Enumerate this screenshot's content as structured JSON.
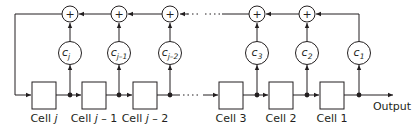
{
  "diagram": {
    "cells": [
      {
        "id": "cell-j",
        "label": "Cell ",
        "label_var": "j",
        "label_suffix": "",
        "x": 32
      },
      {
        "id": "cell-j-1",
        "label": "Cell ",
        "label_var": "j",
        "label_suffix": " – 1",
        "x": 82
      },
      {
        "id": "cell-j-2",
        "label": "Cell ",
        "label_var": "j",
        "label_suffix": " – 2",
        "x": 133
      },
      {
        "id": "cell-3",
        "label": "Cell 3",
        "label_var": "",
        "label_suffix": "",
        "x": 219
      },
      {
        "id": "cell-2",
        "label": "Cell 2",
        "label_var": "",
        "label_suffix": "",
        "x": 269
      },
      {
        "id": "cell-1",
        "label": "Cell 1",
        "label_var": "",
        "label_suffix": "",
        "x": 320
      }
    ],
    "coefficients": [
      {
        "id": "c-j",
        "base": "c",
        "sub": "j",
        "x": 70
      },
      {
        "id": "c-j-1",
        "base": "c",
        "sub": "j–1",
        "x": 119
      },
      {
        "id": "c-j-2",
        "base": "c",
        "sub": "j–2",
        "x": 170
      },
      {
        "id": "c-3",
        "base": "c",
        "sub": "3",
        "x": 257
      },
      {
        "id": "c-2",
        "base": "c",
        "sub": "2",
        "x": 307
      },
      {
        "id": "c-1",
        "base": "c",
        "sub": "1",
        "x": 359
      }
    ],
    "adders": [
      {
        "id": "add-j",
        "symbol": "+",
        "x": 70
      },
      {
        "id": "add-j-1",
        "symbol": "+",
        "x": 119
      },
      {
        "id": "add-j-2",
        "symbol": "+",
        "x": 170
      },
      {
        "id": "add-3",
        "symbol": "+",
        "x": 257
      },
      {
        "id": "add-2",
        "symbol": "+",
        "x": 307
      }
    ],
    "ellipsis": "···",
    "output_label": "Output",
    "colors": {
      "stroke": "#231f20",
      "background": "#ffffff"
    }
  }
}
